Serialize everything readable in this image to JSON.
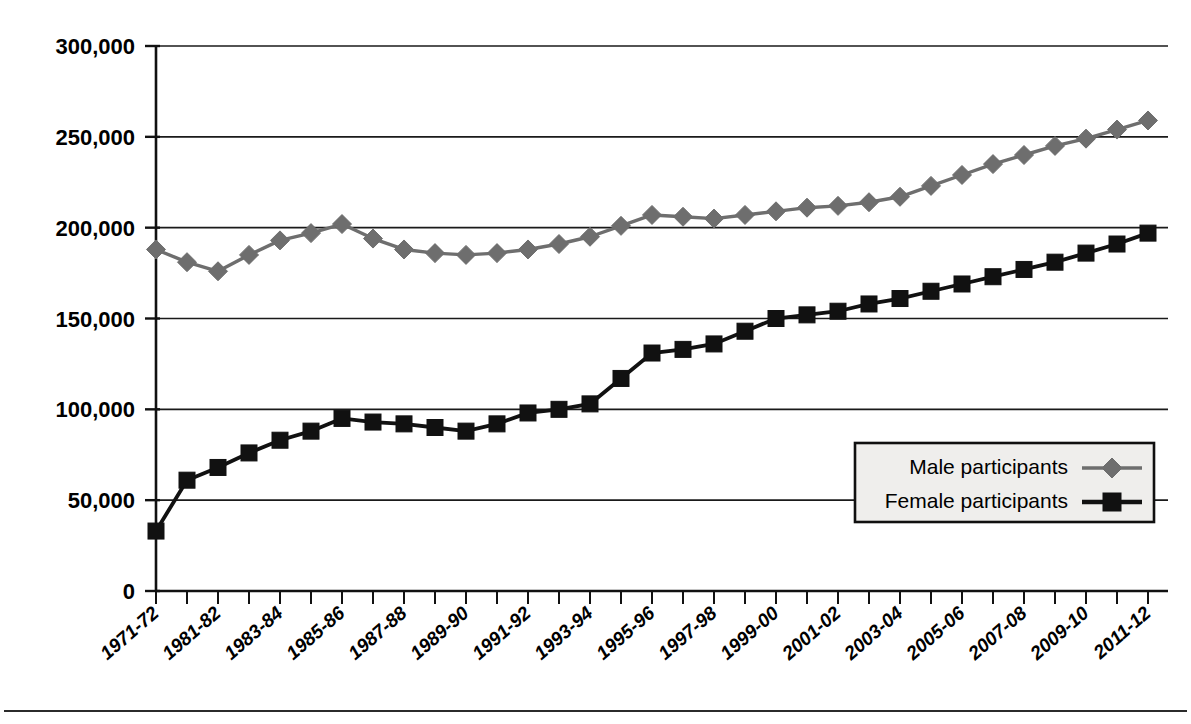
{
  "chart_data": {
    "type": "line",
    "title": "",
    "xlabel": "",
    "ylabel": "",
    "ylim": [
      0,
      300000
    ],
    "yticks": [
      0,
      50000,
      100000,
      150000,
      200000,
      250000,
      300000
    ],
    "ytick_labels": [
      "0",
      "50,000",
      "100,000",
      "150,000",
      "200,000",
      "250,000",
      "300,000"
    ],
    "grid": "horizontal",
    "legend_position": "bottom-right",
    "x": [
      "1971-72",
      "1976-77",
      "1981-82",
      "1982-83",
      "1983-84",
      "1984-85",
      "1985-86",
      "1986-87",
      "1987-88",
      "1988-89",
      "1989-90",
      "1990-91",
      "1991-92",
      "1992-93",
      "1993-94",
      "1994-95",
      "1995-96",
      "1996-97",
      "1997-98",
      "1998-99",
      "1999-00",
      "2000-01",
      "2001-02",
      "2002-03",
      "2003-04",
      "2004-05",
      "2005-06",
      "2006-07",
      "2007-08",
      "2008-09",
      "2009-10",
      "2010-11",
      "2011-12"
    ],
    "xtick_labels_shown": [
      "1971-72",
      "1981-82",
      "1983-84",
      "1985-86",
      "1987-88",
      "1989-90",
      "1991-92",
      "1993-94",
      "1995-96",
      "1997-98",
      "1999-00",
      "2001-02",
      "2003-04",
      "2005-06",
      "2007-08",
      "2009-10",
      "2011-12"
    ],
    "series": [
      {
        "name": "Male participants",
        "color": "#6e6e6e",
        "marker": "diamond",
        "values": [
          188000,
          181000,
          176000,
          185000,
          193000,
          197000,
          202000,
          194000,
          188000,
          186000,
          185000,
          186000,
          188000,
          191000,
          195000,
          201000,
          207000,
          206000,
          205000,
          207000,
          209000,
          211000,
          212000,
          214000,
          217000,
          223000,
          229000,
          235000,
          240000,
          245000,
          249000,
          254000,
          259000
        ]
      },
      {
        "name": "Female participants",
        "color": "#111111",
        "marker": "square",
        "values": [
          33000,
          61000,
          68000,
          76000,
          83000,
          88000,
          95000,
          93000,
          92000,
          90000,
          88000,
          92000,
          98000,
          100000,
          103000,
          117000,
          131000,
          133000,
          136000,
          143000,
          150000,
          152000,
          154000,
          158000,
          161000,
          165000,
          169000,
          173000,
          177000,
          181000,
          186000,
          191000,
          197000
        ]
      }
    ]
  },
  "legend": {
    "entries": [
      {
        "label": "Male participants",
        "marker": "diamond",
        "color": "#6e6e6e"
      },
      {
        "label": "Female participants",
        "marker": "square",
        "color": "#111111"
      }
    ]
  }
}
